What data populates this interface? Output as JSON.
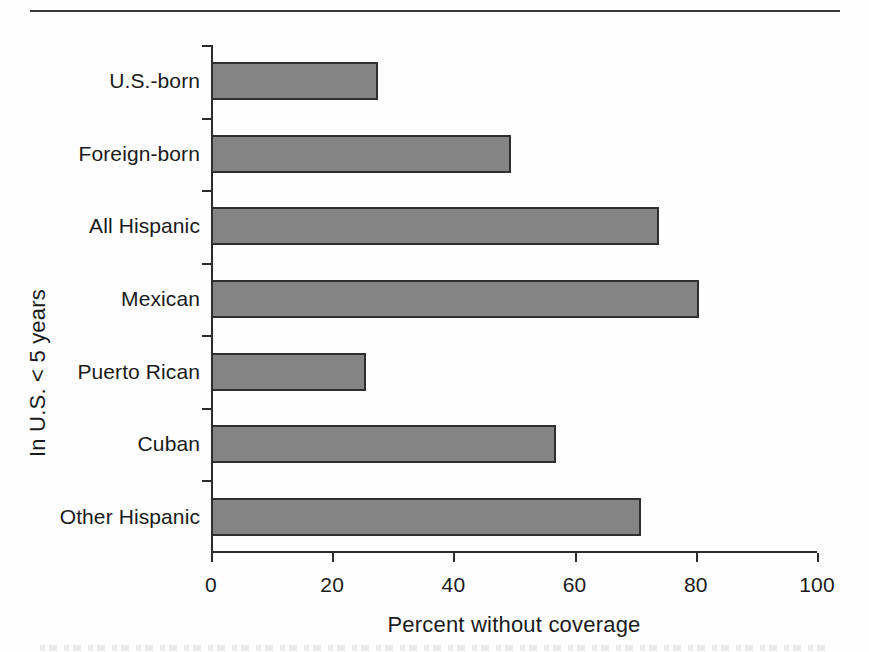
{
  "chart_data": {
    "type": "bar",
    "orientation": "horizontal",
    "title": "",
    "subtitle": "",
    "categories": [
      "U.S.-born",
      "Foreign-born",
      "All Hispanic",
      "Mexican",
      "Puerto Rican",
      "Cuban",
      "Other Hispanic"
    ],
    "values": [
      27.5,
      49.5,
      74,
      80.5,
      25.5,
      57,
      71
    ],
    "series": [
      {
        "name": "Percent without coverage",
        "values": [
          27.5,
          49.5,
          74,
          80.5,
          25.5,
          57,
          71
        ]
      }
    ],
    "xlabel": "Percent without coverage",
    "ylabel": "In U.S. < 5 years",
    "xlim": [
      0,
      100
    ],
    "xticks": [
      0,
      20,
      40,
      60,
      80,
      100
    ],
    "xtick_labels": [
      "0",
      "20",
      "40",
      "60",
      "80",
      "100"
    ],
    "grid": false,
    "legend": false,
    "legend_position": "none",
    "bar_color": "#848484",
    "bar_edge_color": "#2f2f2f",
    "axis_color": "#2b2b2b",
    "text_color": "#1a1a1a",
    "background_color": "#ffffff"
  },
  "figure": {
    "top_rule": "horizontal-rule"
  }
}
